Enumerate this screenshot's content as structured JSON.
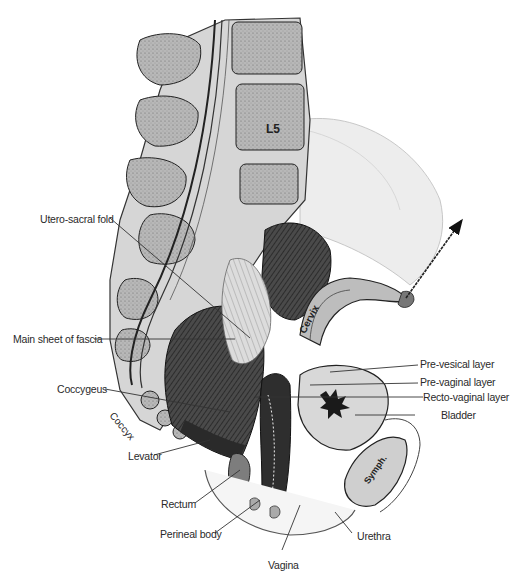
{
  "figure": {
    "type": "anatomical-illustration",
    "in_image_labels": {
      "l5": "L5",
      "cervix": "Cervix",
      "coccyx": "Coccyx",
      "symph": "Symph."
    },
    "callouts": [
      {
        "id": "utero-sacral-fold",
        "text": "Utero-sacral fold"
      },
      {
        "id": "main-sheet-of-fascia",
        "text": "Main sheet of fascia"
      },
      {
        "id": "coccygeus",
        "text": "Coccygeus"
      },
      {
        "id": "levator",
        "text": "Levator"
      },
      {
        "id": "rectum",
        "text": "Rectum"
      },
      {
        "id": "perineal-body",
        "text": "Perineal body"
      },
      {
        "id": "vagina",
        "text": "Vagina"
      },
      {
        "id": "urethra",
        "text": "Urethra"
      },
      {
        "id": "bladder",
        "text": "Bladder"
      },
      {
        "id": "recto-vaginal-layer",
        "text": "Recto-vaginal layer"
      },
      {
        "id": "pre-vaginal-layer",
        "text": "Pre-vaginal layer"
      },
      {
        "id": "pre-vesical-layer",
        "text": "Pre-vesical layer"
      }
    ],
    "colors": {
      "bone_fill": "#b9b9b9",
      "tissue_dark": "#3a3a3a",
      "tissue_mid": "#8a8a8a",
      "tissue_light": "#e6e6e6",
      "label_text": "#2a2a2a",
      "leader_line": "#333333"
    }
  }
}
